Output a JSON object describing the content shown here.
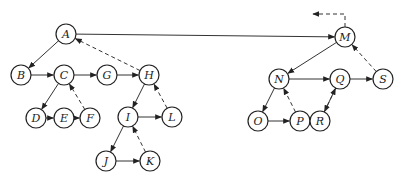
{
  "diagram": {
    "type": "forest-threaded-tree",
    "node_radius": 10,
    "colors": {
      "stroke": "#222222",
      "background": "#ffffff"
    },
    "nodes": [
      {
        "id": "A",
        "label": "A",
        "x": 66,
        "y": 34
      },
      {
        "id": "B",
        "label": "B",
        "x": 21,
        "y": 75
      },
      {
        "id": "C",
        "label": "C",
        "x": 64,
        "y": 75
      },
      {
        "id": "G",
        "label": "G",
        "x": 107,
        "y": 75
      },
      {
        "id": "H",
        "label": "H",
        "x": 149,
        "y": 75
      },
      {
        "id": "D",
        "label": "D",
        "x": 36,
        "y": 118
      },
      {
        "id": "E",
        "label": "E",
        "x": 64,
        "y": 118
      },
      {
        "id": "F",
        "label": "F",
        "x": 90,
        "y": 118
      },
      {
        "id": "I",
        "label": "I",
        "x": 128,
        "y": 117
      },
      {
        "id": "L",
        "label": "L",
        "x": 172,
        "y": 117
      },
      {
        "id": "J",
        "label": "J",
        "x": 106,
        "y": 161
      },
      {
        "id": "K",
        "label": "K",
        "x": 150,
        "y": 161
      },
      {
        "id": "M",
        "label": "M",
        "x": 345,
        "y": 37
      },
      {
        "id": "N",
        "label": "N",
        "x": 279,
        "y": 79
      },
      {
        "id": "Q",
        "label": "Q",
        "x": 340,
        "y": 79
      },
      {
        "id": "S",
        "label": "S",
        "x": 383,
        "y": 79
      },
      {
        "id": "O",
        "label": "O",
        "x": 258,
        "y": 121
      },
      {
        "id": "P",
        "label": "P",
        "x": 300,
        "y": 121
      },
      {
        "id": "R",
        "label": "R",
        "x": 320,
        "y": 121
      }
    ],
    "edges": [
      {
        "from": "A",
        "to": "B",
        "style": "solid"
      },
      {
        "from": "A",
        "to": "M",
        "style": "solid"
      },
      {
        "from": "B",
        "to": "C",
        "style": "solid"
      },
      {
        "from": "C",
        "to": "G",
        "style": "solid"
      },
      {
        "from": "G",
        "to": "H",
        "style": "solid"
      },
      {
        "from": "H",
        "to": "A",
        "style": "dashed"
      },
      {
        "from": "C",
        "to": "D",
        "style": "solid"
      },
      {
        "from": "D",
        "to": "E",
        "style": "solid"
      },
      {
        "from": "E",
        "to": "F",
        "style": "solid"
      },
      {
        "from": "F",
        "to": "C",
        "style": "dashed"
      },
      {
        "from": "H",
        "to": "I",
        "style": "solid"
      },
      {
        "from": "I",
        "to": "L",
        "style": "solid"
      },
      {
        "from": "L",
        "to": "H",
        "style": "dashed"
      },
      {
        "from": "I",
        "to": "J",
        "style": "solid"
      },
      {
        "from": "J",
        "to": "K",
        "style": "solid"
      },
      {
        "from": "K",
        "to": "I",
        "style": "dashed"
      },
      {
        "from": "M",
        "to": "N",
        "style": "solid"
      },
      {
        "from": "N",
        "to": "Q",
        "style": "solid"
      },
      {
        "from": "Q",
        "to": "S",
        "style": "solid"
      },
      {
        "from": "S",
        "to": "M",
        "style": "dashed"
      },
      {
        "from": "N",
        "to": "O",
        "style": "solid"
      },
      {
        "from": "O",
        "to": "P",
        "style": "solid"
      },
      {
        "from": "P",
        "to": "N",
        "style": "dashed"
      },
      {
        "from": "Q",
        "to": "R",
        "style": "solid"
      },
      {
        "from": "R",
        "to": "Q",
        "style": "dashed"
      }
    ],
    "external_thread": {
      "from": "M",
      "style": "dashed",
      "path": [
        [
          345,
          27
        ],
        [
          345,
          14
        ],
        [
          313,
          14
        ]
      ]
    }
  }
}
